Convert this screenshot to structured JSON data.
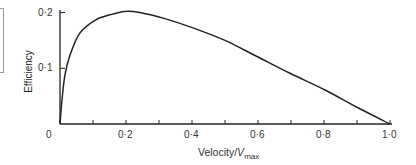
{
  "chart_data": {
    "type": "line",
    "title": "",
    "xlabel": "Velocity/V_max",
    "xlabel_main": "Velocity/",
    "xlabel_var": "V",
    "xlabel_sub": "max",
    "ylabel": "Efficiency",
    "xlim": [
      0,
      1.0
    ],
    "ylim": [
      0,
      0.2
    ],
    "x_ticks": [
      "0",
      "0·2",
      "0·4",
      "0·6",
      "0·8",
      "1·0"
    ],
    "y_ticks": [
      "0·1",
      "0·2"
    ],
    "grid": false,
    "series": [
      {
        "name": "Efficiency",
        "x": [
          0,
          0.006,
          0.015,
          0.03,
          0.06,
          0.106,
          0.152,
          0.197,
          0.242,
          0.318,
          0.409,
          0.5,
          0.597,
          0.697,
          0.803,
          0.9,
          1.0
        ],
        "y": [
          0,
          0.043,
          0.088,
          0.123,
          0.163,
          0.186,
          0.196,
          0.202,
          0.2,
          0.189,
          0.171,
          0.15,
          0.121,
          0.091,
          0.061,
          0.03,
          0
        ]
      }
    ]
  }
}
